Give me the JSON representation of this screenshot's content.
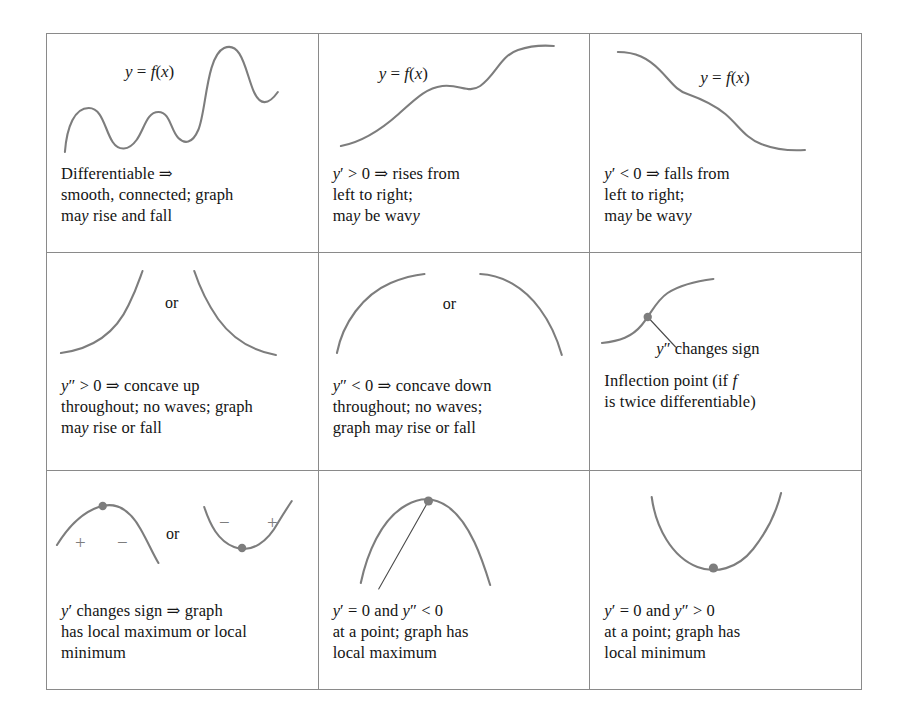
{
  "figure": {
    "type": "reference-table",
    "rows": 3,
    "columns": 3,
    "colors": {
      "curve": "#7d7d7d",
      "border": "#8a8a8a",
      "text": "#141414",
      "background": "#ffffff"
    }
  },
  "cells": [
    {
      "id": "differentiable",
      "function_label": "y = f(x)",
      "graphic": "wavy-curve-rising-and-falling",
      "caption_lines": [
        "Differentiable ⇒",
        "smooth, connected; graph",
        "may rise and fall"
      ]
    },
    {
      "id": "first-derivative-positive",
      "function_label": "y = f(x)",
      "graphic": "increasing-wavy-curve",
      "caption_lines": [
        "y′ > 0 ⇒ rises from",
        "left to right;",
        "may be wavy"
      ]
    },
    {
      "id": "first-derivative-negative",
      "function_label": "y = f(x)",
      "graphic": "decreasing-wavy-curve",
      "caption_lines": [
        "y′ < 0 ⇒ falls from",
        "left to right;",
        "may be wavy"
      ]
    },
    {
      "id": "second-derivative-positive",
      "or_label": "or",
      "graphic": "two-concave-up-arcs",
      "caption_lines": [
        "y″ > 0 ⇒ concave up",
        "throughout; no waves; graph",
        "may rise or fall"
      ]
    },
    {
      "id": "second-derivative-negative",
      "or_label": "or",
      "graphic": "two-concave-down-arcs",
      "caption_lines": [
        "y″ < 0 ⇒ concave down",
        "throughout; no waves;",
        "graph may rise or fall"
      ]
    },
    {
      "id": "inflection-point",
      "annotation": "y″ changes sign",
      "graphic": "s-curve-with-inflection-dot-and-leader-line",
      "caption_lines": [
        "Inflection point (if f",
        "is twice differentiable)"
      ]
    },
    {
      "id": "first-derivative-changes-sign",
      "or_label": "or",
      "graphic": "local-max-arc-and-local-min-arc-with-sign-marks",
      "sign_marks_left": [
        "+",
        "−"
      ],
      "sign_marks_right": [
        "−",
        "+"
      ],
      "caption_lines": [
        "y′ changes sign ⇒ graph",
        "has local maximum or local",
        "minimum"
      ]
    },
    {
      "id": "local-maximum",
      "graphic": "concave-down-arc-with-horizontal-tangent-dot",
      "caption_lines": [
        "y′ = 0  and  y″ < 0",
        "at a point; graph has",
        "local maximum"
      ]
    },
    {
      "id": "local-minimum",
      "graphic": "concave-up-arc-with-minimum-dot",
      "caption_lines": [
        "y′ = 0  and  y″ > 0",
        "at a point; graph has",
        "local minimum"
      ]
    }
  ]
}
